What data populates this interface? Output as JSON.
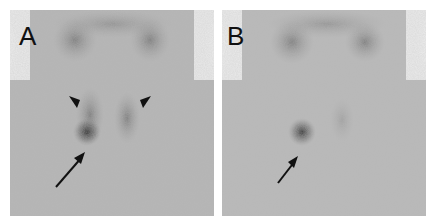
{
  "figure": {
    "panels": [
      {
        "label": "A",
        "annotations": [
          {
            "type": "arrow",
            "points_to": "focal hot spot below left thyroid lobe"
          },
          {
            "type": "arrowhead",
            "side": "left",
            "points_to": "left thyroid lobe"
          },
          {
            "type": "arrowhead",
            "side": "right",
            "points_to": "right thyroid lobe"
          }
        ]
      },
      {
        "label": "B",
        "annotations": [
          {
            "type": "arrow",
            "points_to": "persistent focal hot spot"
          }
        ]
      }
    ],
    "colors": {
      "background": "#ffffff",
      "image_field": "#b9b9b9",
      "uptake": "#3a3a3a",
      "annotation": "#111111"
    }
  }
}
